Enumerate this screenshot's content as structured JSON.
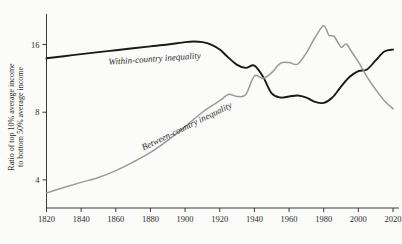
{
  "chart_data": {
    "type": "line",
    "title": "",
    "xlabel": "",
    "ylabel": "Ratio of top 10% average income to bottom 50% average income",
    "ylabel_line1": "Ratio of top 10% average income",
    "ylabel_line2": "to bottom 50% average income",
    "yscale": "log",
    "ylim": [
      3,
      21
    ],
    "xlim": [
      1820,
      2020
    ],
    "yticks": [
      4,
      8,
      16
    ],
    "ytick_labels": [
      "4",
      "8",
      "16"
    ],
    "xticks": [
      1820,
      1840,
      1860,
      1880,
      1900,
      1920,
      1940,
      1960,
      1980,
      2000,
      2020
    ],
    "xtick_labels": [
      "1820",
      "1840",
      "1860",
      "1880",
      "1900",
      "1920",
      "1940",
      "1960",
      "1980",
      "2000",
      "2020"
    ],
    "grid": false,
    "legend_position": "inline-annotation",
    "series": [
      {
        "name": "Within-country inequality",
        "color": "#1a1a1a",
        "width": 1.9,
        "label_x": 1856,
        "label_y": 13.0,
        "label_rotation": -4,
        "x": [
          1820,
          1830,
          1840,
          1850,
          1860,
          1870,
          1880,
          1890,
          1900,
          1905,
          1910,
          1915,
          1920,
          1925,
          1930,
          1935,
          1940,
          1945,
          1950,
          1955,
          1960,
          1965,
          1970,
          1975,
          1980,
          1985,
          1990,
          1995,
          2000,
          2005,
          2010,
          2015,
          2020
        ],
        "values": [
          13.9,
          14.2,
          14.5,
          14.8,
          15.1,
          15.4,
          15.7,
          16.0,
          16.4,
          16.5,
          16.4,
          16.0,
          15.2,
          14.0,
          13.0,
          12.6,
          12.9,
          11.5,
          9.7,
          9.3,
          9.4,
          9.5,
          9.3,
          8.9,
          8.8,
          9.3,
          10.4,
          11.5,
          12.2,
          12.4,
          13.6,
          14.9,
          15.2
        ]
      },
      {
        "name": "Between-country inequality",
        "color": "#9a9a9a",
        "width": 1.5,
        "label_x": 1876,
        "label_y": 5.4,
        "label_rotation": -26,
        "x": [
          1820,
          1830,
          1840,
          1850,
          1860,
          1870,
          1880,
          1890,
          1900,
          1910,
          1920,
          1925,
          1930,
          1935,
          1940,
          1945,
          1950,
          1955,
          1960,
          1965,
          1970,
          1975,
          1980,
          1983,
          1986,
          1990,
          1993,
          1996,
          2000,
          2005,
          2010,
          2015,
          2020
        ],
        "values": [
          3.5,
          3.7,
          3.9,
          4.1,
          4.4,
          4.8,
          5.3,
          6.0,
          6.9,
          8.0,
          9.0,
          9.6,
          9.4,
          9.6,
          11.6,
          11.3,
          12.0,
          13.2,
          13.3,
          13.1,
          14.7,
          17.2,
          19.4,
          17.6,
          17.4,
          15.6,
          16.1,
          14.9,
          13.4,
          11.5,
          10.1,
          9.0,
          8.3
        ]
      }
    ]
  }
}
